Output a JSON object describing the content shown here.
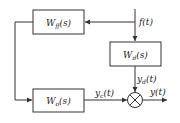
{
  "diagram": {
    "type": "block-diagram",
    "blocks": [
      {
        "id": "wff",
        "label_main": "W",
        "label_sub": "ff",
        "label_arg": "(s)"
      },
      {
        "id": "wd",
        "label_main": "W",
        "label_sub": "d",
        "label_arg": "(s)"
      },
      {
        "id": "wo",
        "label_main": "W",
        "label_sub": "o",
        "label_arg": "(s)"
      }
    ],
    "signals": {
      "input": {
        "main": "f",
        "arg": "(t)"
      },
      "yd": {
        "main": "y",
        "sub": "d",
        "arg": "(t)"
      },
      "yc": {
        "main": "y",
        "sub": "c",
        "arg": "(t)"
      },
      "output": {
        "main": "y",
        "arg": "(t)"
      }
    },
    "junction": {
      "symbol": "⊗",
      "type": "summing"
    },
    "colors": {
      "line": "#333333",
      "background": "#ffffff"
    }
  }
}
